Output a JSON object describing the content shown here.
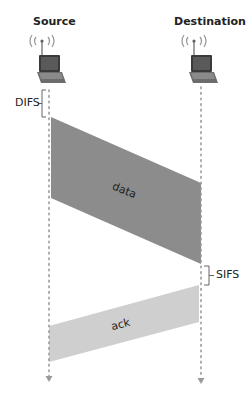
{
  "diagram": {
    "type": "sequence-timing",
    "nodes": [
      {
        "id": "source",
        "label": "Source",
        "icon": "wireless-laptop-icon"
      },
      {
        "id": "destination",
        "label": "Destination",
        "icon": "wireless-laptop-icon"
      }
    ],
    "intervals": [
      {
        "id": "difs",
        "label": "DIFS",
        "at": "source",
        "position": "before-data"
      },
      {
        "id": "sifs",
        "label": "SIFS",
        "at": "destination",
        "position": "between-data-and-ack"
      }
    ],
    "messages": [
      {
        "id": "data",
        "label": "data",
        "from": "source",
        "to": "destination",
        "color": "#8c8c8c"
      },
      {
        "id": "ack",
        "label": "ack",
        "from": "destination",
        "to": "source",
        "color": "#cfcfcf"
      }
    ],
    "colors": {
      "timeline": "#9a9a9a",
      "data_frame": "#8c8c8c",
      "ack_frame": "#cfcfcf",
      "bracket": "#555555"
    }
  }
}
